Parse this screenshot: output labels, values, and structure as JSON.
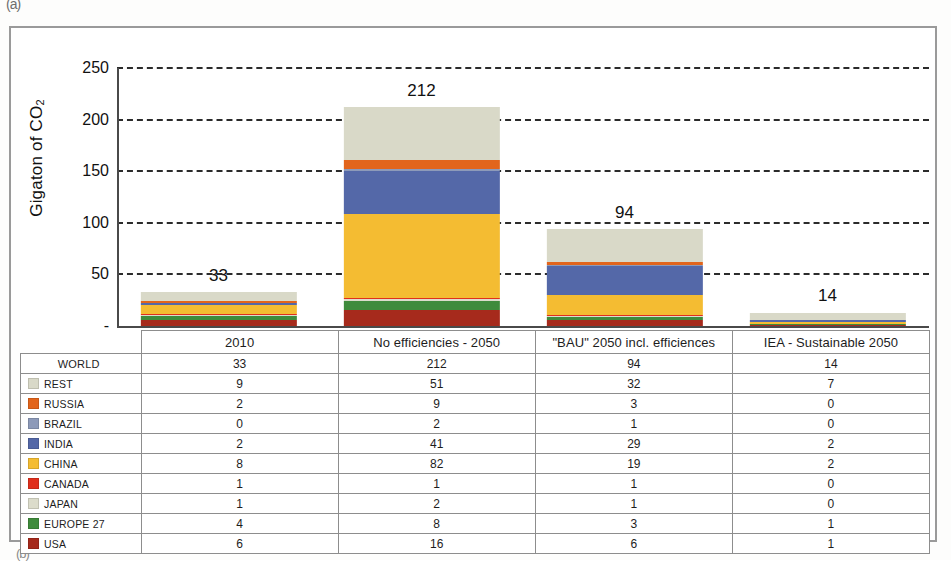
{
  "figure": {
    "fragment_top": "(a)",
    "fragment_bottom": "(b)"
  },
  "chart_data": {
    "type": "bar",
    "subtype": "stacked-bar",
    "title": "",
    "xlabel": "",
    "ylabel": "Gigaton of CO",
    "ylabel_sub": "2",
    "ylim": [
      0,
      250
    ],
    "yticks": [
      "250",
      "200",
      "150",
      "100",
      "50",
      "-"
    ],
    "ytick_values": [
      250,
      200,
      150,
      100,
      50,
      0
    ],
    "grid": "horizontal-dashed",
    "legend_position": "table-below",
    "categories": [
      "2010",
      "No efficiencies -  2050",
      "\"BAU\" 2050 incl. efficiences",
      "IEA - Sustainable 2050"
    ],
    "totals": [
      33,
      212,
      94,
      14
    ],
    "total_labels": [
      "33",
      "212",
      "94",
      "14"
    ],
    "stack_order_bottom_to_top": [
      "USA",
      "EUROPE 27",
      "JAPAN",
      "CANADA",
      "CHINA",
      "INDIA",
      "BRAZIL",
      "RUSSIA",
      "REST"
    ],
    "series": [
      {
        "name": "REST",
        "color": "#d9d9c8",
        "values": [
          9,
          51,
          32,
          7
        ]
      },
      {
        "name": "RUSSIA",
        "color": "#e2651c",
        "values": [
          2,
          9,
          3,
          0
        ]
      },
      {
        "name": "BRAZIL",
        "color": "#8d9ab9",
        "values": [
          0,
          2,
          1,
          0
        ]
      },
      {
        "name": "INDIA",
        "color": "#5468a8",
        "values": [
          2,
          41,
          29,
          2
        ]
      },
      {
        "name": "CHINA",
        "color": "#f4bc32",
        "values": [
          8,
          82,
          19,
          2
        ]
      },
      {
        "name": "CANADA",
        "color": "#e0301d",
        "values": [
          1,
          1,
          1,
          0
        ]
      },
      {
        "name": "JAPAN",
        "color": "#dcdccb",
        "values": [
          1,
          2,
          1,
          0
        ]
      },
      {
        "name": "EUROPE 27",
        "color": "#3f8b3c",
        "values": [
          4,
          8,
          3,
          1
        ]
      },
      {
        "name": "USA",
        "color": "#a62a1c",
        "values": [
          6,
          16,
          6,
          1
        ]
      }
    ]
  },
  "table": {
    "corner_label": "",
    "headers": [
      "2010",
      "No efficiencies -  2050",
      "\"BAU\" 2050 incl. efficiences",
      "IEA - Sustainable 2050"
    ],
    "rows": [
      {
        "label": "WORLD",
        "swatch": "none",
        "values": [
          "33",
          "212",
          "94",
          "14"
        ]
      },
      {
        "label": "REST",
        "swatch": "#d9d9c8",
        "values": [
          "9",
          "51",
          "32",
          "7"
        ]
      },
      {
        "label": "RUSSIA",
        "swatch": "#e2651c",
        "values": [
          "2",
          "9",
          "3",
          "0"
        ]
      },
      {
        "label": "BRAZIL",
        "swatch": "#8d9ab9",
        "values": [
          "0",
          "2",
          "1",
          "0"
        ]
      },
      {
        "label": "INDIA",
        "swatch": "#5468a8",
        "values": [
          "2",
          "41",
          "29",
          "2"
        ]
      },
      {
        "label": "CHINA",
        "swatch": "#f4bc32",
        "values": [
          "8",
          "82",
          "19",
          "2"
        ]
      },
      {
        "label": "CANADA",
        "swatch": "#e0301d",
        "values": [
          "1",
          "1",
          "1",
          "0"
        ]
      },
      {
        "label": "JAPAN",
        "swatch": "#dcdccb",
        "values": [
          "1",
          "2",
          "1",
          "0"
        ]
      },
      {
        "label": "EUROPE 27",
        "swatch": "#3f8b3c",
        "values": [
          "4",
          "8",
          "3",
          "1"
        ]
      },
      {
        "label": "USA",
        "swatch": "#a62a1c",
        "values": [
          "6",
          "16",
          "6",
          "1"
        ]
      }
    ]
  }
}
